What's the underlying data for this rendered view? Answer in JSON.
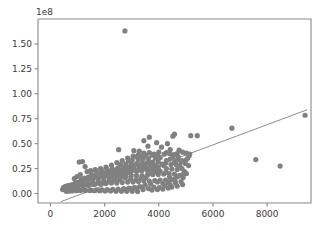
{
  "chart_data": {
    "type": "scatter",
    "title": "",
    "xlabel": "",
    "ylabel": "",
    "y_offset_text": "1e8",
    "y_offset_value": 100000000,
    "xlim": [
      -460,
      9620
    ],
    "ylim": [
      -9500000,
      175000000
    ],
    "grid": false,
    "legend": null,
    "marker_color": "#808080",
    "marker_size": 5.2,
    "line_color": "#808080",
    "xticks": [
      0,
      2000,
      4000,
      6000,
      8000
    ],
    "xtick_labels": [
      "0",
      "2000",
      "4000",
      "6000",
      "8000"
    ],
    "yticks": [
      0,
      25000000,
      50000000,
      75000000,
      100000000,
      125000000,
      150000000
    ],
    "ytick_labels": [
      "0.00",
      "0.25",
      "0.50",
      "0.75",
      "1.00",
      "1.25",
      "1.50"
    ],
    "trendline": {
      "x": [
        380,
        9480
      ],
      "y": [
        -8200000,
        84000000
      ]
    },
    "points": [
      [
        2750,
        163000000
      ],
      [
        9400,
        78500000
      ],
      [
        6700,
        65500000
      ],
      [
        7580,
        34000000
      ],
      [
        8480,
        27500000
      ],
      [
        5420,
        58000000
      ],
      [
        5180,
        58000000
      ],
      [
        4580,
        59500000
      ],
      [
        4520,
        57500000
      ],
      [
        3650,
        56500000
      ],
      [
        3450,
        53000000
      ],
      [
        3920,
        51000000
      ],
      [
        4320,
        50000000
      ],
      [
        3600,
        47500000
      ],
      [
        4100,
        46500000
      ],
      [
        2520,
        44000000
      ],
      [
        4420,
        44000000
      ],
      [
        4750,
        43500000
      ],
      [
        3080,
        43000000
      ],
      [
        3280,
        42500000
      ],
      [
        4880,
        41500000
      ],
      [
        5020,
        40500000
      ],
      [
        4680,
        40000000
      ],
      [
        4400,
        40000000
      ],
      [
        4200,
        39500000
      ],
      [
        3950,
        39000000
      ],
      [
        3750,
        38500000
      ],
      [
        3520,
        38000000
      ],
      [
        3350,
        37500000
      ],
      [
        3180,
        37000000
      ],
      [
        4520,
        37000000
      ],
      [
        4720,
        36500000
      ],
      [
        4050,
        36000000
      ],
      [
        3880,
        35500000
      ],
      [
        3620,
        35000000
      ],
      [
        3420,
        34500000
      ],
      [
        3240,
        34000000
      ],
      [
        3020,
        33500000
      ],
      [
        2880,
        33000000
      ],
      [
        4280,
        33000000
      ],
      [
        4620,
        32500000
      ],
      [
        4820,
        32000000
      ],
      [
        3980,
        32000000
      ],
      [
        3780,
        31500000
      ],
      [
        3580,
        31000000
      ],
      [
        3380,
        30500000
      ],
      [
        3180,
        30000000
      ],
      [
        2980,
        30000000
      ],
      [
        2780,
        29500000
      ],
      [
        2580,
        29000000
      ],
      [
        4450,
        29000000
      ],
      [
        4650,
        28500000
      ],
      [
        4180,
        28000000
      ],
      [
        3880,
        28000000
      ],
      [
        3680,
        27500000
      ],
      [
        3480,
        27000000
      ],
      [
        3280,
        27000000
      ],
      [
        3080,
        26500000
      ],
      [
        2880,
        26000000
      ],
      [
        2680,
        26000000
      ],
      [
        2480,
        25500000
      ],
      [
        2280,
        25000000
      ],
      [
        4280,
        25000000
      ],
      [
        4480,
        24500000
      ],
      [
        4680,
        24000000
      ],
      [
        3980,
        24000000
      ],
      [
        3780,
        23500000
      ],
      [
        3580,
        23000000
      ],
      [
        3380,
        23000000
      ],
      [
        3180,
        22500000
      ],
      [
        2980,
        22000000
      ],
      [
        2780,
        22000000
      ],
      [
        2580,
        21500000
      ],
      [
        2380,
        21000000
      ],
      [
        2180,
        21000000
      ],
      [
        1980,
        20500000
      ],
      [
        1780,
        20000000
      ],
      [
        4380,
        20000000
      ],
      [
        4580,
        19500000
      ],
      [
        4180,
        19500000
      ],
      [
        3980,
        19000000
      ],
      [
        3780,
        19000000
      ],
      [
        3580,
        18500000
      ],
      [
        3380,
        18000000
      ],
      [
        3180,
        18000000
      ],
      [
        2980,
        17500000
      ],
      [
        2780,
        17000000
      ],
      [
        2580,
        17000000
      ],
      [
        2380,
        16500000
      ],
      [
        2180,
        16000000
      ],
      [
        1980,
        16000000
      ],
      [
        1780,
        15500000
      ],
      [
        1580,
        15000000
      ],
      [
        1380,
        15000000
      ],
      [
        1180,
        14500000
      ],
      [
        4450,
        14000000
      ],
      [
        4250,
        13500000
      ],
      [
        4050,
        13500000
      ],
      [
        3850,
        13000000
      ],
      [
        3650,
        12500000
      ],
      [
        3450,
        12500000
      ],
      [
        3250,
        12000000
      ],
      [
        3050,
        11500000
      ],
      [
        2850,
        11500000
      ],
      [
        2650,
        11000000
      ],
      [
        2450,
        10500000
      ],
      [
        2250,
        10500000
      ],
      [
        2050,
        10000000
      ],
      [
        1850,
        9500000
      ],
      [
        1650,
        9500000
      ],
      [
        1450,
        9000000
      ],
      [
        1250,
        8500000
      ],
      [
        1050,
        8500000
      ],
      [
        900,
        8000000
      ],
      [
        780,
        7500000
      ],
      [
        660,
        7000000
      ],
      [
        560,
        6500000
      ],
      [
        480,
        6000000
      ],
      [
        520,
        5000000
      ],
      [
        620,
        4500000
      ],
      [
        720,
        4000000
      ],
      [
        850,
        4000000
      ],
      [
        980,
        3500000
      ],
      [
        1120,
        3500000
      ],
      [
        1280,
        3000000
      ],
      [
        1450,
        3000000
      ],
      [
        1620,
        2800000
      ],
      [
        1820,
        2800000
      ],
      [
        2020,
        2600000
      ],
      [
        2220,
        2600000
      ],
      [
        2420,
        2400000
      ],
      [
        2620,
        2400000
      ],
      [
        2820,
        2200000
      ],
      [
        3020,
        2200000
      ],
      [
        3220,
        2000000
      ],
      [
        3420,
        4000000
      ],
      [
        3620,
        5000000
      ],
      [
        3820,
        6500000
      ],
      [
        4020,
        6000000
      ],
      [
        4220,
        8000000
      ],
      [
        4420,
        9000000
      ],
      [
        4620,
        10500000
      ],
      [
        4820,
        12000000
      ],
      [
        5020,
        20000000
      ],
      [
        4950,
        22000000
      ],
      [
        4860,
        25000000
      ],
      [
        4780,
        28000000
      ],
      [
        5060,
        35000000
      ],
      [
        5120,
        38000000
      ],
      [
        1060,
        31500000
      ],
      [
        1180,
        32000000
      ],
      [
        1280,
        27000000
      ],
      [
        1350,
        22000000
      ],
      [
        1100,
        19000000
      ],
      [
        980,
        17000000
      ],
      [
        880,
        15000000
      ],
      [
        1500,
        21000000
      ],
      [
        1680,
        23000000
      ],
      [
        1880,
        24000000
      ],
      [
        2080,
        24500000
      ],
      [
        2280,
        22000000
      ],
      [
        2480,
        20000000
      ],
      [
        2680,
        18000000
      ],
      [
        2400,
        13000000
      ],
      [
        2200,
        12000000
      ],
      [
        2000,
        11000000
      ],
      [
        1800,
        10000000
      ],
      [
        1600,
        9000000
      ],
      [
        1400,
        8000000
      ],
      [
        1200,
        7000000
      ],
      [
        1000,
        6500000
      ],
      [
        850,
        6000000
      ],
      [
        700,
        5500000
      ],
      [
        600,
        5000000
      ],
      [
        500,
        4500000
      ],
      [
        450,
        4000000
      ],
      [
        3100,
        6000000
      ],
      [
        3300,
        7000000
      ],
      [
        3500,
        8500000
      ],
      [
        3700,
        9500000
      ],
      [
        2900,
        5500000
      ],
      [
        2700,
        5000000
      ],
      [
        2500,
        4500000
      ],
      [
        2300,
        4200000
      ],
      [
        2100,
        4000000
      ],
      [
        1900,
        3800000
      ],
      [
        1700,
        3600000
      ],
      [
        1500,
        3400000
      ],
      [
        1300,
        3200000
      ],
      [
        1100,
        3000000
      ],
      [
        950,
        2800000
      ],
      [
        800,
        2600000
      ],
      [
        680,
        2400000
      ],
      [
        580,
        2200000
      ],
      [
        4150,
        4500000
      ],
      [
        4350,
        5500000
      ],
      [
        3950,
        4000000
      ],
      [
        3750,
        3500000
      ],
      [
        4700,
        17000000
      ],
      [
        4900,
        16000000
      ],
      [
        4600,
        15000000
      ],
      [
        4400,
        16500000
      ],
      [
        4250,
        21000000
      ],
      [
        4050,
        22500000
      ],
      [
        3900,
        21500000
      ],
      [
        3700,
        20500000
      ],
      [
        3520,
        16000000
      ],
      [
        3340,
        15000000
      ],
      [
        3160,
        14000000
      ],
      [
        2960,
        14500000
      ],
      [
        2760,
        15500000
      ],
      [
        2560,
        14000000
      ],
      [
        2360,
        13500000
      ],
      [
        2160,
        13000000
      ],
      [
        1960,
        12500000
      ],
      [
        1760,
        12000000
      ],
      [
        1560,
        11500000
      ],
      [
        1360,
        11000000
      ],
      [
        1160,
        10500000
      ],
      [
        1020,
        10000000
      ],
      [
        920,
        9500000
      ],
      [
        820,
        9000000
      ],
      [
        740,
        8500000
      ],
      [
        660,
        8000000
      ],
      [
        600,
        7500000
      ],
      [
        540,
        7000000
      ],
      [
        4980,
        30000000
      ],
      [
        5100,
        28000000
      ],
      [
        4880,
        19000000
      ],
      [
        4760,
        18000000
      ],
      [
        4580,
        31000000
      ],
      [
        4420,
        34500000
      ],
      [
        4260,
        30500000
      ],
      [
        4120,
        29500000
      ],
      [
        3980,
        26500000
      ],
      [
        3840,
        25500000
      ],
      [
        3700,
        24500000
      ],
      [
        3560,
        25000000
      ],
      [
        3420,
        26000000
      ],
      [
        3280,
        24000000
      ],
      [
        3140,
        23500000
      ],
      [
        3000,
        23000000
      ],
      [
        2860,
        21000000
      ],
      [
        2720,
        19500000
      ],
      [
        2580,
        18500000
      ],
      [
        2440,
        18000000
      ],
      [
        2300,
        17500000
      ],
      [
        2160,
        17000000
      ],
      [
        2020,
        18000000
      ],
      [
        1880,
        17500000
      ],
      [
        1740,
        16500000
      ],
      [
        1600,
        16000000
      ],
      [
        1460,
        14500000
      ],
      [
        1320,
        13500000
      ],
      [
        1180,
        12500000
      ],
      [
        1040,
        11500000
      ],
      [
        920,
        11000000
      ],
      [
        4350,
        11000000
      ],
      [
        4150,
        10000000
      ],
      [
        3950,
        11500000
      ],
      [
        3780,
        30000000
      ],
      [
        3640,
        31500000
      ],
      [
        3500,
        29500000
      ],
      [
        3360,
        28500000
      ],
      [
        3220,
        29000000
      ],
      [
        3080,
        28000000
      ],
      [
        2940,
        27000000
      ],
      [
        2800,
        25500000
      ],
      [
        2660,
        24500000
      ],
      [
        2520,
        23500000
      ],
      [
        2380,
        23000000
      ],
      [
        2240,
        22500000
      ],
      [
        2100,
        21500000
      ],
      [
        1960,
        20500000
      ],
      [
        1820,
        19500000
      ],
      [
        1680,
        18500000
      ],
      [
        1540,
        17500000
      ],
      [
        1400,
        16500000
      ],
      [
        1260,
        15500000
      ],
      [
        1140,
        14500000
      ],
      [
        4700,
        34000000
      ],
      [
        4860,
        33000000
      ],
      [
        5000,
        33500000
      ],
      [
        5140,
        39500000
      ],
      [
        4550,
        39000000
      ],
      [
        4280,
        41000000
      ],
      [
        4000,
        41500000
      ],
      [
        3820,
        39500000
      ],
      [
        3650,
        41000000
      ],
      [
        3450,
        40500000
      ],
      [
        3250,
        39000000
      ],
      [
        3050,
        37500000
      ],
      [
        2850,
        35500000
      ],
      [
        2650,
        33000000
      ],
      [
        2450,
        31000000
      ],
      [
        2250,
        28500000
      ],
      [
        2050,
        26500000
      ],
      [
        1850,
        25000000
      ],
      [
        1650,
        24000000
      ],
      [
        1480,
        23000000
      ],
      [
        3380,
        6500000
      ],
      [
        3180,
        5500000
      ],
      [
        2980,
        4800000
      ],
      [
        2780,
        4200000
      ],
      [
        4480,
        6500000
      ],
      [
        4680,
        7500000
      ],
      [
        4880,
        9000000
      ],
      [
        4600,
        12500000
      ]
    ]
  },
  "axes": {
    "spine_color": "#8a8a8a",
    "tick_color": "#3a3a3a",
    "background": "#ffffff"
  }
}
